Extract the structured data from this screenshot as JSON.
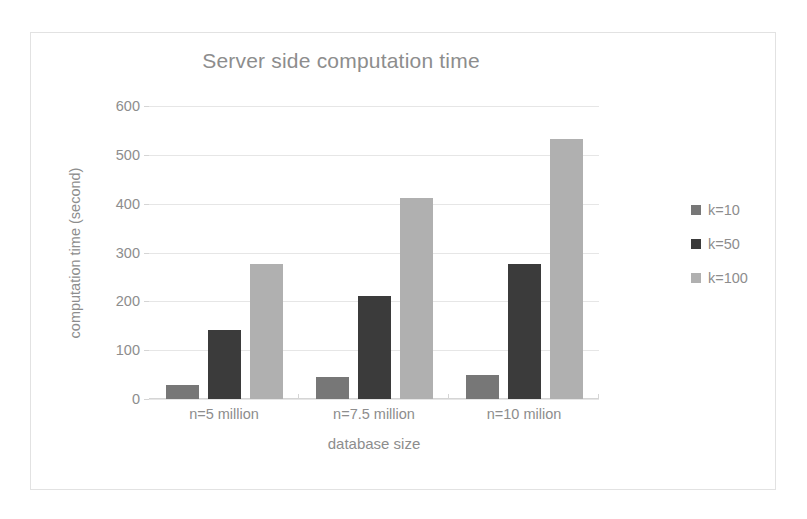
{
  "chart_data": {
    "type": "bar",
    "title": "Server side computation time",
    "xlabel": "database size",
    "ylabel": "computation time (second)",
    "categories": [
      "n=5 million",
      "n=7.5 million",
      "n=10 milion"
    ],
    "series": [
      {
        "name": "k=10",
        "color": "#777777",
        "values": [
          29,
          45,
          50
        ]
      },
      {
        "name": "k=50",
        "color": "#3b3b3b",
        "values": [
          142,
          210,
          277
        ]
      },
      {
        "name": "k=100",
        "color": "#b0b0b0",
        "values": [
          277,
          411,
          533
        ]
      }
    ],
    "ylim": [
      0,
      600
    ],
    "yticks": [
      0,
      100,
      200,
      300,
      400,
      500,
      600
    ],
    "ytick_labels": [
      "0",
      "100",
      "200",
      "300",
      "400",
      "500",
      "600"
    ],
    "grid": "horizontal",
    "legend_position": "right",
    "title_color": "#8d8d8d",
    "text_color": "#8d8d8d",
    "gridline_color": "#e6e6e6",
    "border_color": "#e2e2e2",
    "background": "#ffffff"
  }
}
